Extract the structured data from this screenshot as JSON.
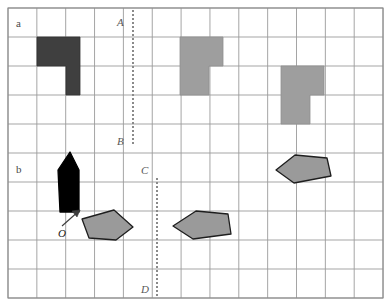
{
  "figure": {
    "title_visible": false,
    "background": "#ffffff",
    "width": 388,
    "height": 306
  },
  "grid": {
    "name": "square-lattice",
    "left": 8,
    "top": 8,
    "right": 383,
    "bottom": 298,
    "columns": 13,
    "rows": 10,
    "cell_width": 28.85,
    "cell_height": 29.0,
    "line_color": "#9b9b9b",
    "line_width": 0.9,
    "border_color": "#8c8c8c",
    "border_width": 1.1
  },
  "panel_labels": [
    {
      "text": "a",
      "x": 16,
      "y": 18
    },
    {
      "text": "b",
      "x": 16,
      "y": 164
    }
  ],
  "axis_labels": [
    {
      "text": "A",
      "x": 117,
      "y": 17
    },
    {
      "text": "B",
      "x": 117,
      "y": 136
    },
    {
      "text": "C",
      "x": 141,
      "y": 165
    },
    {
      "text": "D",
      "x": 141,
      "y": 284
    }
  ],
  "origin_label": {
    "text": "O",
    "x": 58,
    "y": 228
  },
  "dashed_lines": [
    {
      "name": "dashed-line-AB",
      "x": 133,
      "y1": 10,
      "y2": 145,
      "color": "#8a8a8a",
      "width": 2,
      "dash": "2 2"
    },
    {
      "name": "dashed-line-CD",
      "x": 157,
      "y1": 178,
      "y2": 296,
      "color": "#8a8a8a",
      "width": 2,
      "dash": "2 2"
    }
  ],
  "colors": {
    "dark_fill": "#3f3f3f",
    "dark_stroke": "#343434",
    "gray_fill": "#9e9e9e",
    "gray_stroke": "#8f8f8f",
    "black_fill": "#000000",
    "polygon_fill": "#9a9a9a",
    "polygon_stroke": "#1e1e1e",
    "arrow_color": "#3c3c3c"
  },
  "tetromino_shapes": [
    {
      "name": "dark-tetromino-left",
      "fill": "#3f3f3f",
      "stroke": "#343434",
      "points": "37,37 80,37 80,95 66,95 66,66 37,66"
    },
    {
      "name": "gray-tetromino-middle",
      "fill": "#9e9e9e",
      "stroke": "#8f8f8f",
      "points": "180,37 223,37 223,66 209,66 209,95 180,95"
    },
    {
      "name": "gray-tetromino-right",
      "fill": "#9e9e9e",
      "stroke": "#8f8f8f",
      "points": "281,66 324,66 324,95 310,95 310,124 281,124"
    }
  ],
  "polygon_shapes": [
    {
      "name": "black-pentagon-vessel",
      "fill": "#000000",
      "stroke": "#000000",
      "points": "70,152 79,170 79,212 60,212 58,170"
    },
    {
      "name": "gray-pentagon-lower-left",
      "fill": "#9a9a9a",
      "stroke": "#1e1e1e",
      "points": "82,219 114,210 133,227 116,240 89,238"
    },
    {
      "name": "gray-pentagon-lower-middle",
      "fill": "#9a9a9a",
      "stroke": "#1e1e1e",
      "points": "173,226 196,211 228,214 231,234 193,239"
    },
    {
      "name": "gray-pentagon-right",
      "fill": "#9a9a9a",
      "stroke": "#1e1e1e",
      "points": "276,170 295,155 327,158 331,176 294,183"
    }
  ],
  "arrow": {
    "name": "origin-arrow",
    "x1": 62,
    "y1": 226,
    "x2": 80,
    "y2": 210,
    "color": "#3c3c3c",
    "width": 1.2,
    "head_points": "80,210 72,211 77,217"
  }
}
